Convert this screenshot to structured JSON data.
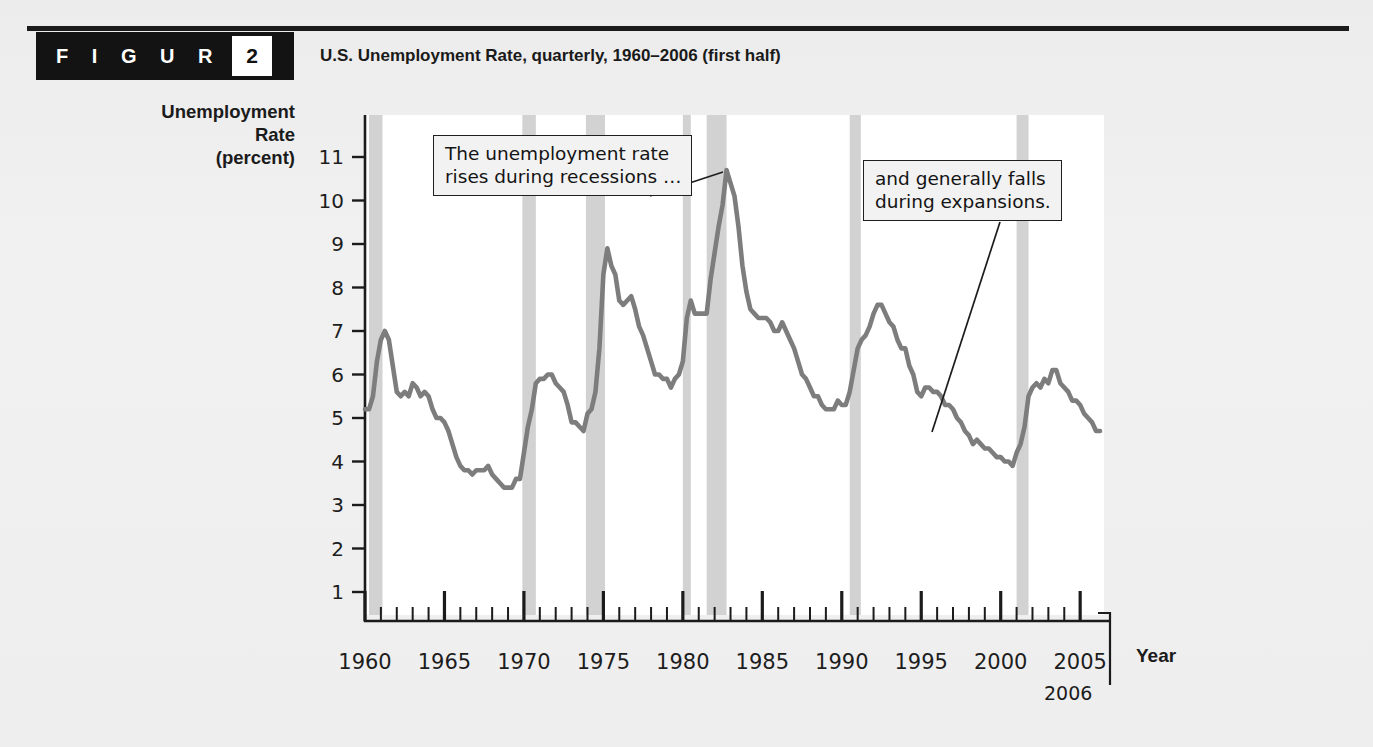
{
  "figure": {
    "banner_word": "F I G U R E",
    "number": "2",
    "title": "U.S. Unemployment Rate, quarterly, 1960–2006 (first half)"
  },
  "axes": {
    "y_title": "Unemployment\nRate\n(percent)",
    "x_title": "Year",
    "x_end_label": "2006",
    "y_ticks": [
      11,
      10,
      9,
      8,
      7,
      6,
      5,
      4,
      3,
      2,
      1
    ],
    "x_major_ticks": [
      "1960",
      "1965",
      "1970",
      "1975",
      "1980",
      "1985",
      "1990",
      "1995",
      "2000",
      "2005"
    ],
    "x_minor_tick_interval_years": 1
  },
  "annotations": [
    {
      "name": "recession-callout",
      "text": "The unemployment rate\nrises during recessions …"
    },
    {
      "name": "expansion-callout",
      "text": "and generally falls\nduring expansions."
    }
  ],
  "colors": {
    "line": "#7d7d7d",
    "recession_band": "#d2d2d2",
    "plot_background": "#ffffff",
    "axis": "#1b1b1b",
    "banner": "#131313",
    "page_background": "#eeeeee"
  },
  "chart_data": {
    "type": "line",
    "title": "U.S. Unemployment Rate, quarterly, 1960–2006 (first half)",
    "xlabel": "Year",
    "ylabel": "Unemployment Rate (percent)",
    "xlim": [
      1960.0,
      2006.5
    ],
    "ylim": [
      0,
      11.6
    ],
    "grid": false,
    "legend": "none",
    "x_unit": "quarter",
    "series": [
      {
        "name": "Unemployment rate (percent)",
        "x": [
          1960.0,
          1960.25,
          1960.5,
          1960.75,
          1961.0,
          1961.25,
          1961.5,
          1961.75,
          1962.0,
          1962.25,
          1962.5,
          1962.75,
          1963.0,
          1963.25,
          1963.5,
          1963.75,
          1964.0,
          1964.25,
          1964.5,
          1964.75,
          1965.0,
          1965.25,
          1965.5,
          1965.75,
          1966.0,
          1966.25,
          1966.5,
          1966.75,
          1967.0,
          1967.25,
          1967.5,
          1967.75,
          1968.0,
          1968.25,
          1968.5,
          1968.75,
          1969.0,
          1969.25,
          1969.5,
          1969.75,
          1970.0,
          1970.25,
          1970.5,
          1970.75,
          1971.0,
          1971.25,
          1971.5,
          1971.75,
          1972.0,
          1972.25,
          1972.5,
          1972.75,
          1973.0,
          1973.25,
          1973.5,
          1973.75,
          1974.0,
          1974.25,
          1974.5,
          1974.75,
          1975.0,
          1975.25,
          1975.5,
          1975.75,
          1976.0,
          1976.25,
          1976.5,
          1976.75,
          1977.0,
          1977.25,
          1977.5,
          1977.75,
          1978.0,
          1978.25,
          1978.5,
          1978.75,
          1979.0,
          1979.25,
          1979.5,
          1979.75,
          1980.0,
          1980.25,
          1980.5,
          1980.75,
          1981.0,
          1981.25,
          1981.5,
          1981.75,
          1982.0,
          1982.25,
          1982.5,
          1982.75,
          1983.0,
          1983.25,
          1983.5,
          1983.75,
          1984.0,
          1984.25,
          1984.5,
          1984.75,
          1985.0,
          1985.25,
          1985.5,
          1985.75,
          1986.0,
          1986.25,
          1986.5,
          1986.75,
          1987.0,
          1987.25,
          1987.5,
          1987.75,
          1988.0,
          1988.25,
          1988.5,
          1988.75,
          1989.0,
          1989.25,
          1989.5,
          1989.75,
          1990.0,
          1990.25,
          1990.5,
          1990.75,
          1991.0,
          1991.25,
          1991.5,
          1991.75,
          1992.0,
          1992.25,
          1992.5,
          1992.75,
          1993.0,
          1993.25,
          1993.5,
          1993.75,
          1994.0,
          1994.25,
          1994.5,
          1994.75,
          1995.0,
          1995.25,
          1995.5,
          1995.75,
          1996.0,
          1996.25,
          1996.5,
          1996.75,
          1997.0,
          1997.25,
          1997.5,
          1997.75,
          1998.0,
          1998.25,
          1998.5,
          1998.75,
          1999.0,
          1999.25,
          1999.5,
          1999.75,
          2000.0,
          2000.25,
          2000.5,
          2000.75,
          2001.0,
          2001.25,
          2001.5,
          2001.75,
          2002.0,
          2002.25,
          2002.5,
          2002.75,
          2003.0,
          2003.25,
          2003.5,
          2003.75,
          2004.0,
          2004.25,
          2004.5,
          2004.75,
          2005.0,
          2005.25,
          2005.5,
          2005.75,
          2006.0,
          2006.25
        ],
        "y": [
          5.2,
          5.2,
          5.5,
          6.3,
          6.8,
          7.0,
          6.8,
          6.2,
          5.6,
          5.5,
          5.6,
          5.5,
          5.8,
          5.7,
          5.5,
          5.6,
          5.5,
          5.2,
          5.0,
          5.0,
          4.9,
          4.7,
          4.4,
          4.1,
          3.9,
          3.8,
          3.8,
          3.7,
          3.8,
          3.8,
          3.8,
          3.9,
          3.7,
          3.6,
          3.5,
          3.4,
          3.4,
          3.4,
          3.6,
          3.6,
          4.2,
          4.8,
          5.2,
          5.8,
          5.9,
          5.9,
          6.0,
          6.0,
          5.8,
          5.7,
          5.6,
          5.3,
          4.9,
          4.9,
          4.8,
          4.7,
          5.1,
          5.2,
          5.6,
          6.6,
          8.3,
          8.9,
          8.5,
          8.3,
          7.7,
          7.6,
          7.7,
          7.8,
          7.5,
          7.1,
          6.9,
          6.6,
          6.3,
          6.0,
          6.0,
          5.9,
          5.9,
          5.7,
          5.9,
          6.0,
          6.3,
          7.3,
          7.7,
          7.4,
          7.4,
          7.4,
          7.4,
          8.2,
          8.8,
          9.4,
          9.9,
          10.7,
          10.4,
          10.1,
          9.4,
          8.5,
          7.9,
          7.5,
          7.4,
          7.3,
          7.3,
          7.3,
          7.2,
          7.0,
          7.0,
          7.2,
          7.0,
          6.8,
          6.6,
          6.3,
          6.0,
          5.9,
          5.7,
          5.5,
          5.5,
          5.3,
          5.2,
          5.2,
          5.2,
          5.4,
          5.3,
          5.3,
          5.6,
          6.1,
          6.6,
          6.8,
          6.9,
          7.1,
          7.4,
          7.6,
          7.6,
          7.4,
          7.2,
          7.1,
          6.8,
          6.6,
          6.6,
          6.2,
          6.0,
          5.6,
          5.5,
          5.7,
          5.7,
          5.6,
          5.6,
          5.5,
          5.3,
          5.3,
          5.2,
          5.0,
          4.9,
          4.7,
          4.6,
          4.4,
          4.5,
          4.4,
          4.3,
          4.3,
          4.2,
          4.1,
          4.1,
          4.0,
          4.0,
          3.9,
          4.2,
          4.4,
          4.8,
          5.5,
          5.7,
          5.8,
          5.7,
          5.9,
          5.8,
          6.1,
          6.1,
          5.8,
          5.7,
          5.6,
          5.4,
          5.4,
          5.3,
          5.1,
          5.0,
          4.9,
          4.7,
          4.7
        ]
      }
    ],
    "recession_bands": [
      {
        "label": "1960–1961",
        "start": 1960.25,
        "end": 1961.1
      },
      {
        "label": "1969–1970",
        "start": 1969.9,
        "end": 1970.75
      },
      {
        "label": "1973–1975",
        "start": 1973.9,
        "end": 1975.1
      },
      {
        "label": "1980",
        "start": 1980.0,
        "end": 1980.5
      },
      {
        "label": "1981–1982",
        "start": 1981.5,
        "end": 1982.75
      },
      {
        "label": "1990–1991",
        "start": 1990.5,
        "end": 1991.2
      },
      {
        "label": "2001",
        "start": 2001.0,
        "end": 2001.75
      }
    ],
    "peak": {
      "year": 1982.75,
      "value": 10.7
    },
    "trough": {
      "year": 2000.75,
      "value": 3.9
    }
  }
}
